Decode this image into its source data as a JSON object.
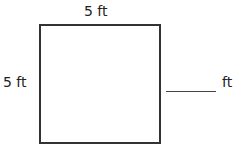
{
  "figure": {
    "shape": "square",
    "top_side_label": "5 ft",
    "left_side_label": "5 ft",
    "answer_blank": "",
    "answer_unit": "ft"
  }
}
